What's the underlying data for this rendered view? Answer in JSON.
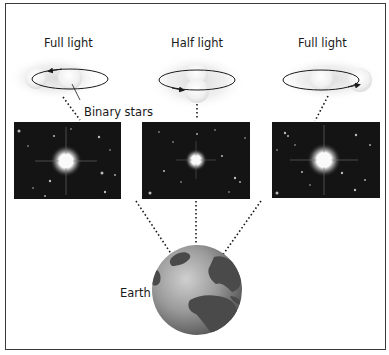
{
  "diagram": {
    "columns": [
      {
        "label": "Full light",
        "state": "stars-side-by-side"
      },
      {
        "label": "Half light",
        "state": "stars-eclipsing"
      },
      {
        "label": "Full light",
        "state": "stars-side-by-side"
      }
    ],
    "callout": "Binary stars",
    "earth_label": "Earth",
    "colors": {
      "border": "#3a3a3a",
      "sky": "#141414",
      "earth_land": "#4a4a4a",
      "earth_ocean": "#9a9a9a",
      "star_glow": "#e8e8e8"
    }
  }
}
